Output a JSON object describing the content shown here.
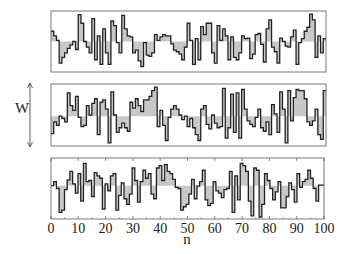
{
  "chart_data": {
    "type": "line",
    "subtype": "step",
    "title": "",
    "xlabel": "n",
    "ylabel": "W",
    "xlim": [
      0,
      100
    ],
    "x_ticks": [
      0,
      10,
      20,
      30,
      40,
      50,
      60,
      70,
      80,
      90,
      100
    ],
    "x_tick_labels": [
      "0",
      "10",
      "20",
      "30",
      "40",
      "50",
      "60",
      "70",
      "80",
      "90",
      "100"
    ],
    "ylim": [
      0,
      1
    ],
    "grid": false,
    "legend": null,
    "fill_to_mean": true,
    "mean_level": 0.5,
    "colors": {
      "line": "#222222",
      "fill": "#c8c8c8",
      "frame": "#555555"
    },
    "series": [
      {
        "name": "panel-top",
        "mean": 0.5,
        "values": [
          0.68,
          0.6,
          0.52,
          0.12,
          0.22,
          0.3,
          0.38,
          0.44,
          0.5,
          0.36,
          0.97,
          0.82,
          0.5,
          0.4,
          0.3,
          0.9,
          0.18,
          0.6,
          0.1,
          0.72,
          0.3,
          0.1,
          0.86,
          0.78,
          0.48,
          0.3,
          0.96,
          0.72,
          0.6,
          0.58,
          0.3,
          0.35,
          0.16,
          0.06,
          0.48,
          0.26,
          0.24,
          0.3,
          0.62,
          0.52,
          0.58,
          0.62,
          0.6,
          0.6,
          0.46,
          0.35,
          0.32,
          0.28,
          0.18,
          0.4,
          0.82,
          0.52,
          0.1,
          0.55,
          0.18,
          0.76,
          0.62,
          0.82,
          0.82,
          0.3,
          0.12,
          0.78,
          0.52,
          0.72,
          0.6,
          0.18,
          0.58,
          0.22,
          0.18,
          0.3,
          0.6,
          0.55,
          0.56,
          0.2,
          0.28,
          0.62,
          0.64,
          0.45,
          0.14,
          0.72,
          0.88,
          0.4,
          0.32,
          0.12,
          0.56,
          0.5,
          0.42,
          0.4,
          0.58,
          0.7,
          0.1,
          0.48,
          0.55,
          0.68,
          0.75,
          0.98,
          0.88,
          0.22,
          0.6,
          0.3,
          0.55
        ]
      },
      {
        "name": "panel-middle",
        "mean": 0.48,
        "values": [
          0.18,
          0.38,
          0.32,
          0.48,
          0.44,
          0.38,
          0.88,
          0.66,
          0.58,
          0.82,
          0.46,
          0.3,
          0.32,
          0.66,
          0.5,
          0.7,
          0.78,
          0.16,
          0.72,
          0.76,
          0.6,
          0.02,
          0.9,
          0.5,
          0.2,
          0.28,
          0.36,
          0.28,
          0.22,
          0.72,
          0.62,
          0.78,
          0.66,
          0.56,
          0.76,
          0.76,
          0.82,
          0.92,
          0.98,
          0.3,
          0.58,
          0.32,
          0.06,
          0.46,
          0.6,
          0.66,
          0.6,
          0.5,
          0.42,
          0.48,
          0.3,
          0.44,
          0.28,
          0.16,
          0.06,
          0.6,
          0.66,
          0.34,
          0.26,
          0.5,
          0.36,
          0.28,
          0.3,
          0.96,
          0.1,
          0.28,
          0.86,
          0.2,
          0.88,
          0.1,
          0.94,
          0.6,
          0.4,
          0.34,
          0.3,
          0.46,
          0.6,
          0.28,
          0.22,
          0.38,
          0.16,
          0.68,
          0.52,
          0.2,
          0.9,
          0.6,
          0.02,
          0.92,
          0.4,
          0.8,
          0.94,
          0.92,
          0.92,
          0.78,
          0.38,
          0.32,
          0.4,
          0.6,
          0.16,
          0.08,
          0.92
        ]
      },
      {
        "name": "panel-bottom",
        "mean": 0.55,
        "values": [
          0.55,
          0.62,
          0.5,
          0.08,
          0.12,
          0.48,
          0.65,
          0.8,
          0.58,
          0.42,
          0.76,
          0.28,
          0.94,
          0.62,
          0.64,
          0.36,
          0.78,
          0.72,
          0.68,
          0.14,
          0.58,
          0.46,
          0.72,
          0.76,
          0.12,
          0.38,
          0.6,
          0.32,
          0.22,
          0.4,
          0.86,
          0.64,
          0.26,
          0.62,
          0.82,
          0.68,
          0.76,
          0.4,
          0.32,
          0.86,
          0.9,
          0.64,
          0.92,
          0.8,
          0.76,
          0.66,
          0.52,
          0.5,
          0.12,
          0.18,
          0.22,
          0.4,
          0.66,
          0.32,
          0.54,
          0.62,
          0.82,
          0.3,
          0.2,
          0.24,
          0.62,
          0.46,
          0.42,
          0.34,
          0.48,
          0.5,
          0.8,
          0.08,
          0.72,
          0.3,
          0.94,
          0.9,
          0.8,
          0.28,
          0.02,
          0.86,
          0.82,
          0.0,
          0.22,
          0.76,
          0.64,
          0.5,
          0.3,
          0.44,
          0.62,
          0.16,
          0.16,
          0.36,
          0.6,
          0.48,
          0.26,
          0.76,
          0.52,
          0.62,
          0.66,
          0.82,
          0.68,
          0.5,
          0.28,
          0.56,
          0.56
        ]
      }
    ]
  },
  "axes": {
    "x_label": "n",
    "y_label": "W"
  }
}
